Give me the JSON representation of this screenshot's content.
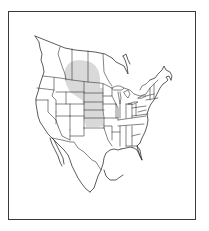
{
  "map": {
    "type": "species-range-map",
    "region": "North America (Canada, United States, Mexico)",
    "frame": {
      "border_color": "#3a3a3a",
      "background": "#ffffff"
    },
    "colors": {
      "range_fill": "#d9d9d9",
      "boundary_stroke": "#333333",
      "land": "#ffffff"
    },
    "range": {
      "description": "Great Plains",
      "areas": [
        "southern Alberta",
        "southern Saskatchewan",
        "eastern Montana",
        "North Dakota",
        "South Dakota",
        "Nebraska",
        "Kansas",
        "northern Oklahoma"
      ]
    },
    "labels": []
  }
}
